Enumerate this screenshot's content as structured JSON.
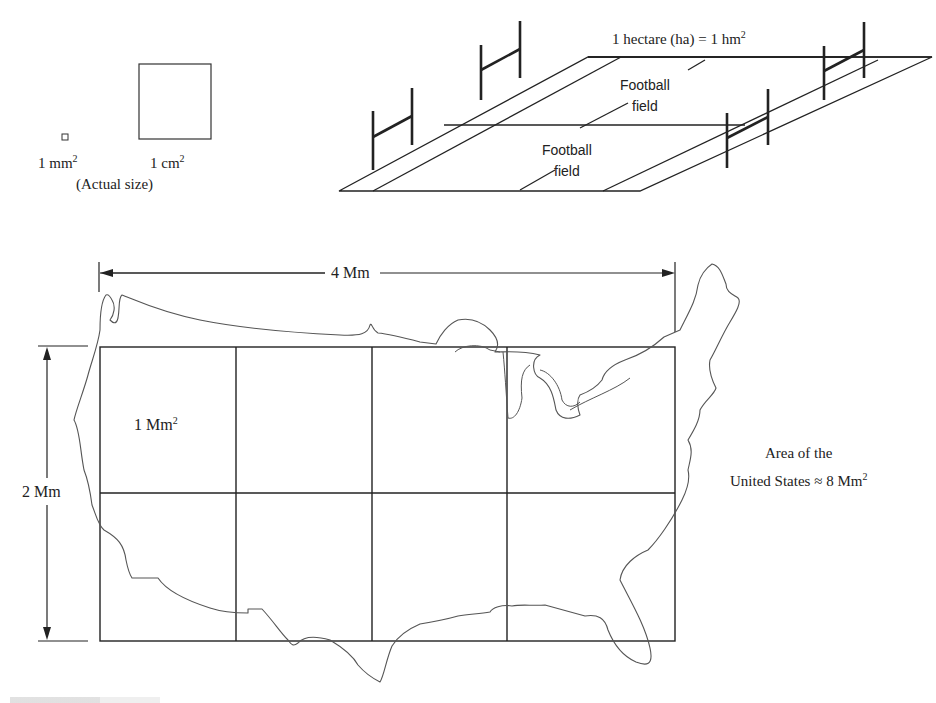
{
  "figure": {
    "panels": {
      "small_squares": {
        "mm2_label": "1 mm",
        "mm2_exp": "2",
        "cm2_label": "1 cm",
        "cm2_exp": "2",
        "note": "(Actual size)"
      },
      "hectare": {
        "label": "1 hectare (ha) = 1 hm",
        "label_exp": "2",
        "field_1": {
          "line1": "Football",
          "line2": "field"
        },
        "field_2": {
          "line1": "Football",
          "line2": "field"
        }
      },
      "us_map": {
        "width_label": "4 Mm",
        "height_label": "2 Mm",
        "cell_label": "1 Mm",
        "cell_exp": "2",
        "grid": {
          "columns": 4,
          "rows": 2
        },
        "area_line1": "Area of the",
        "area_line2": "United States ≈ 8 Mm",
        "area_exp": "2"
      }
    },
    "colors": {
      "ink": "#222222",
      "map_outline": "#555555",
      "background": "#ffffff"
    }
  }
}
